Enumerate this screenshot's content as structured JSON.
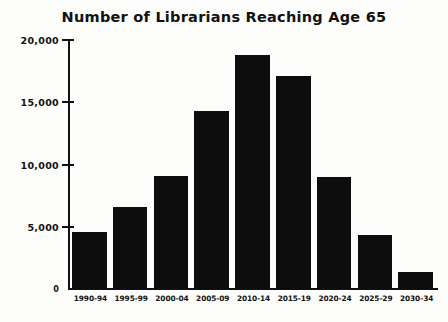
{
  "chart_data": {
    "type": "bar",
    "title": "Number of Librarians Reaching Age 65",
    "xlabel": "",
    "ylabel": "",
    "categories": [
      "1990-94",
      "1995-99",
      "2000-04",
      "2005-09",
      "2010-14",
      "2015-19",
      "2020-24",
      "2025-29",
      "2030-34"
    ],
    "values": [
      4600,
      6600,
      9100,
      14300,
      18800,
      17100,
      9000,
      4300,
      1400
    ],
    "ylim": [
      0,
      20000
    ],
    "yticks": [
      0,
      5000,
      10000,
      15000,
      20000
    ],
    "ytick_labels": [
      "0",
      "5,000",
      "10,000",
      "15,000",
      "20,000"
    ],
    "grid": false,
    "legend": null,
    "bar_color": "#0d0d0d",
    "background_color": "#fdfdfb",
    "axis_color": "#111111"
  }
}
